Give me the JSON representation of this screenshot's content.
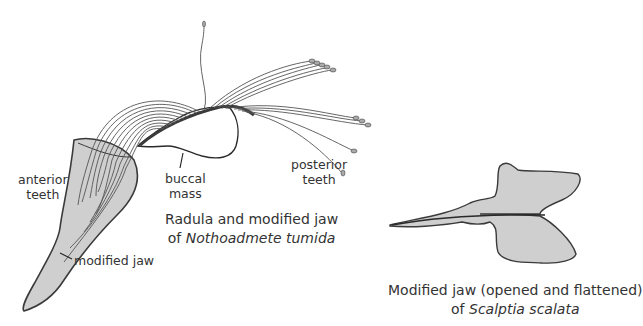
{
  "figure_left": {
    "labels": {
      "anterior_teeth": [
        "anterior",
        "teeth"
      ],
      "buccal_mass": [
        "buccal",
        "mass"
      ],
      "posterior_teeth": [
        "posterior",
        "teeth"
      ],
      "modified_jaw": "modified jaw"
    },
    "caption": {
      "line1": "Radula and modified jaw",
      "line2_prefix": "of ",
      "line2_species": "Nothoadmete tumida"
    }
  },
  "figure_right": {
    "caption": {
      "line1": "Modified jaw (opened and flattened)",
      "line2_prefix": "of ",
      "line2_species": "Scalptia scalata"
    }
  },
  "colors": {
    "fill_gray": "#cfcfcf",
    "outline": "#3a3a3a",
    "background": "#ffffff"
  }
}
